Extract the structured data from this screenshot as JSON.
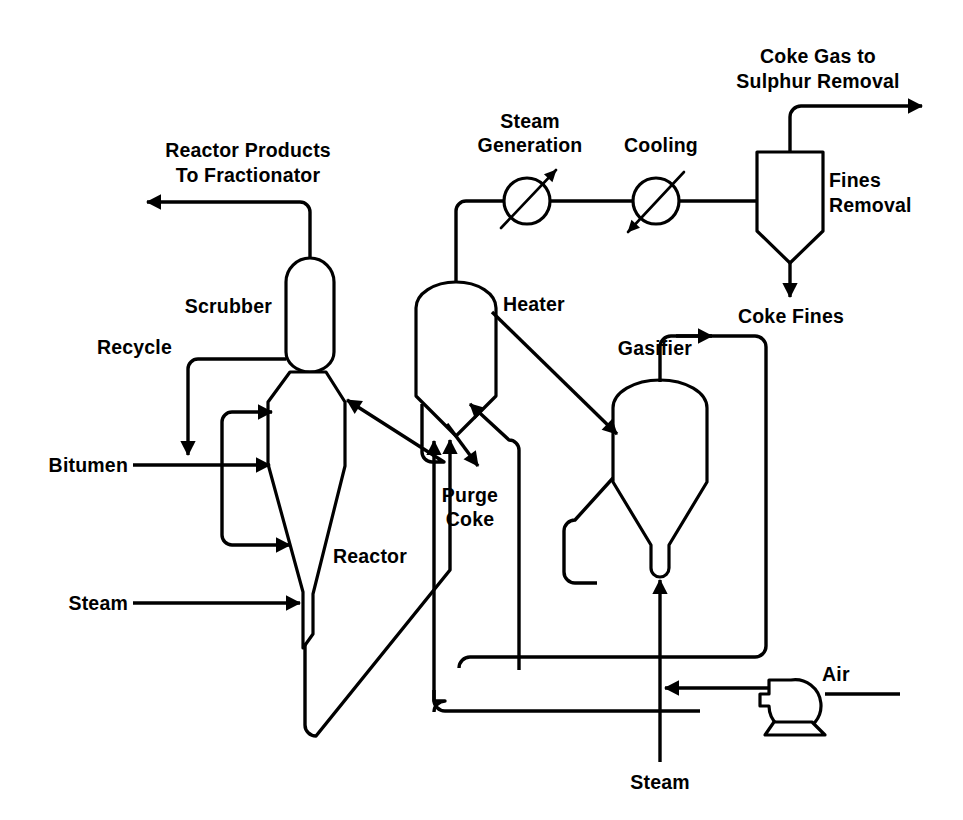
{
  "diagram": {
    "type": "process-flow-diagram",
    "background_color": "#ffffff",
    "line_color": "#000000"
  },
  "labels": {
    "reactor_products": "Reactor Products\nTo Fractionator",
    "reactor_products_line1": "Reactor Products",
    "reactor_products_line2": "To Fractionator",
    "scrubber": "Scrubber",
    "recycle": "Recycle",
    "bitumen": "Bitumen",
    "steam_left": "Steam",
    "reactor": "Reactor",
    "heater": "Heater",
    "purge_coke_line1": "Purge",
    "purge_coke_line2": "Coke",
    "steam_generation_line1": "Steam",
    "steam_generation_line2": "Generation",
    "cooling": "Cooling",
    "coke_gas_line1": "Coke Gas to",
    "coke_gas_line2": "Sulphur Removal",
    "fines_removal_line1": "Fines",
    "fines_removal_line2": "Removal",
    "coke_fines": "Coke Fines",
    "gasifier": "Gasifier",
    "air": "Air",
    "steam_bottom": "Steam"
  },
  "equipment": [
    {
      "id": "scrubber",
      "name": "Scrubber",
      "shape": "vertical-vessel-rounded"
    },
    {
      "id": "reactor",
      "name": "Reactor",
      "shape": "tapered-vessel"
    },
    {
      "id": "heater",
      "name": "Heater",
      "shape": "domed-vessel-cone-bottom"
    },
    {
      "id": "gasifier",
      "name": "Gasifier",
      "shape": "domed-vessel-cone-bottom"
    },
    {
      "id": "fines-removal",
      "name": "Fines Removal",
      "shape": "box-cone-bottom"
    },
    {
      "id": "steam-generation",
      "name": "Steam Generation",
      "shape": "heat-exchanger-circle"
    },
    {
      "id": "cooling",
      "name": "Cooling",
      "shape": "heat-exchanger-circle"
    },
    {
      "id": "air-blower",
      "name": "Air",
      "shape": "blower"
    }
  ],
  "streams": [
    {
      "id": "reactor-products",
      "label": "Reactor Products To Fractionator",
      "from": "scrubber",
      "to": "fractionator",
      "direction": "out-left"
    },
    {
      "id": "recycle",
      "label": "Recycle",
      "from": "scrubber",
      "to": "reactor",
      "direction": "in"
    },
    {
      "id": "bitumen",
      "label": "Bitumen",
      "from": "feed",
      "to": "reactor",
      "direction": "in"
    },
    {
      "id": "steam-reactor",
      "label": "Steam",
      "from": "utility",
      "to": "reactor",
      "direction": "in"
    },
    {
      "id": "purge-coke",
      "label": "Purge Coke",
      "from": "heater",
      "to": "disposal",
      "direction": "out-down"
    },
    {
      "id": "coke-gas",
      "label": "Coke Gas to Sulphur Removal",
      "from": "fines-removal",
      "to": "sulphur-removal",
      "direction": "out-right"
    },
    {
      "id": "coke-fines",
      "label": "Coke Fines",
      "from": "fines-removal",
      "to": "disposal",
      "direction": "out-down"
    },
    {
      "id": "air",
      "label": "Air",
      "from": "air-blower",
      "to": "gasifier",
      "direction": "in"
    },
    {
      "id": "steam-gasifier",
      "label": "Steam",
      "from": "utility",
      "to": "gasifier",
      "direction": "in"
    }
  ]
}
